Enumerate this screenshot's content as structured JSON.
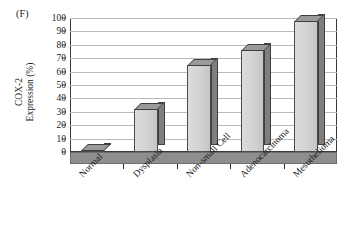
{
  "figure": {
    "panel_label": "(F)",
    "y_axis_title_line1": "COX-2",
    "y_axis_title_line2": "Expression (%)"
  },
  "axis": {
    "y_ticks": [
      "0",
      "10",
      "20",
      "30",
      "40",
      "50",
      "60",
      "70",
      "80",
      "90",
      "100"
    ],
    "y_min": 0,
    "y_max": 100,
    "y_step": 10
  },
  "colors": {
    "bar_front": "#d2d2d2",
    "bar_side": "#7f7f7f",
    "bar_top": "#9a9a9a",
    "gridline": "#b9b9b9",
    "axis": "#3a3a3a",
    "text": "#1a1a1a"
  },
  "chart_data": {
    "type": "bar",
    "title": "(F)",
    "xlabel": "",
    "ylabel": "COX-2 Expression (%)",
    "ylim": [
      0,
      100
    ],
    "yticks": [
      0,
      10,
      20,
      30,
      40,
      50,
      60,
      70,
      80,
      90,
      100
    ],
    "grid": true,
    "legend": false,
    "style": "3d-column",
    "categories": [
      "Normal",
      "Dysplasia",
      "Non-small Cell",
      "Adenocarcinoma",
      "Mesothelioma"
    ],
    "values": [
      1,
      32,
      65,
      76,
      98
    ],
    "series": [
      {
        "name": "COX-2 Expression (%)",
        "values": [
          1,
          32,
          65,
          76,
          98
        ]
      }
    ]
  }
}
